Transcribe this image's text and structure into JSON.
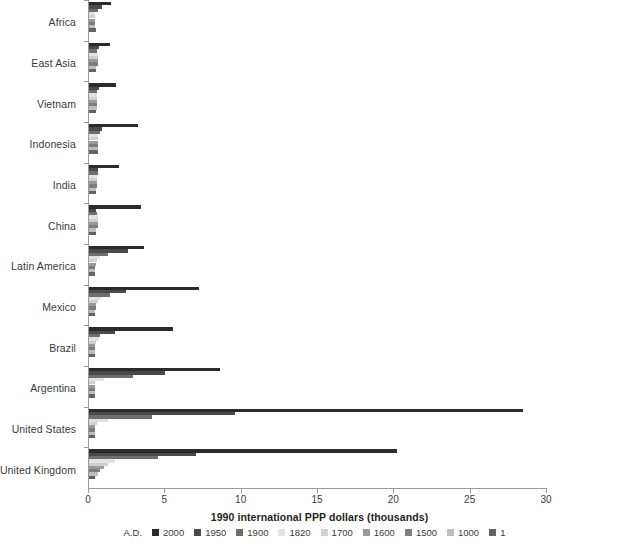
{
  "chart": {
    "xlabel": "1990 international PPP dollars (thousands)",
    "legend_title": "A.D.",
    "bottom_caption": ""
  },
  "chart_data": {
    "type": "bar",
    "orientation": "horizontal",
    "title": "",
    "subtitle": "",
    "xlabel": "1990 international PPP dollars (thousands)",
    "ylabel": "",
    "xlim": [
      0,
      30
    ],
    "xticks": [
      0,
      5,
      10,
      15,
      20,
      25,
      30
    ],
    "xtick_labels": [
      "0",
      "5",
      "10",
      "15",
      "20",
      "25",
      "30"
    ],
    "grid": false,
    "legend_position": "bottom",
    "legend_title": "A.D.",
    "categories": [
      "Africa",
      "East Asia",
      "Vietnam",
      "Indonesia",
      "India",
      "China",
      "Latin America",
      "Mexico",
      "Brazil",
      "Argentina",
      "United States",
      "United Kingdom"
    ],
    "series": [
      {
        "name": "2000",
        "color": "#2b2b2b",
        "values": [
          1.45,
          1.4,
          1.8,
          3.2,
          1.95,
          3.4,
          3.6,
          7.2,
          5.5,
          8.6,
          28.4,
          20.2
        ]
      },
      {
        "name": "1950",
        "color": "#4a4a4a",
        "values": [
          0.85,
          0.65,
          0.65,
          0.85,
          0.62,
          0.45,
          2.55,
          2.4,
          1.7,
          5.0,
          9.55,
          7.0
        ]
      },
      {
        "name": "1900",
        "color": "#6e6e6e",
        "values": [
          0.6,
          0.55,
          0.5,
          0.7,
          0.6,
          0.55,
          1.25,
          1.35,
          0.7,
          2.9,
          4.1,
          4.55
        ]
      },
      {
        "name": "1820",
        "color": "#e2e2e2",
        "values": [
          0.42,
          0.58,
          0.55,
          0.6,
          0.53,
          0.6,
          0.7,
          0.76,
          0.65,
          1.0,
          1.26,
          1.71
        ]
      },
      {
        "name": "1700",
        "color": "#d0d0d0",
        "values": [
          0.42,
          0.58,
          0.55,
          0.58,
          0.55,
          0.6,
          0.55,
          0.57,
          0.46,
          0.4,
          0.53,
          1.25
        ]
      },
      {
        "name": "1600",
        "color": "#9a9a9a",
        "values": [
          0.42,
          0.58,
          0.55,
          0.57,
          0.55,
          0.6,
          0.44,
          0.45,
          0.42,
          0.4,
          0.4,
          0.97
        ]
      },
      {
        "name": "1500",
        "color": "#7d7d7d",
        "values": [
          0.41,
          0.57,
          0.55,
          0.57,
          0.55,
          0.6,
          0.42,
          0.43,
          0.4,
          0.4,
          0.4,
          0.71
        ]
      },
      {
        "name": "1000",
        "color": "#bdbdbd",
        "values": [
          0.42,
          0.45,
          0.5,
          0.57,
          0.45,
          0.45,
          0.4,
          0.4,
          0.4,
          0.4,
          0.4,
          0.6
        ]
      },
      {
        "name": "1",
        "color": "#636363",
        "values": [
          0.47,
          0.45,
          0.47,
          0.57,
          0.45,
          0.45,
          0.4,
          0.4,
          0.4,
          0.4,
          0.4,
          0.4
        ]
      }
    ]
  }
}
